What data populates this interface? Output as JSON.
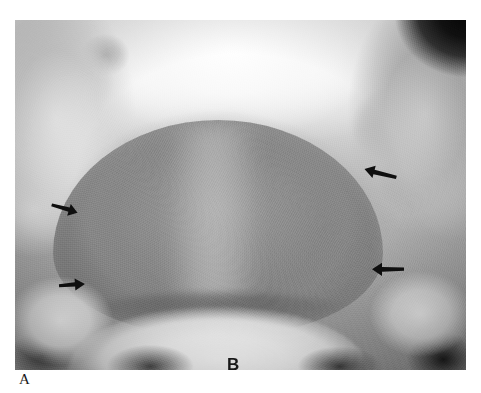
{
  "figure": {
    "panel_label": "A",
    "inner_label": "B",
    "modality": "radiograph",
    "view": "anteroposterior pelvis",
    "background_color": "#ffffff"
  },
  "radiograph": {
    "name": "pelvic-radiograph",
    "left": 15,
    "top": 20,
    "width": 451,
    "height": 350,
    "tone_light": "#f7f7f7",
    "tone_mid": "#a6a6a6",
    "tone_dark": "#1a1a1a"
  },
  "structures": [
    {
      "name": "dome-opacity",
      "description": "large dome-shaped soft-tissue opacity in central pelvis",
      "tone": "#8e8e8e"
    },
    {
      "name": "bright-crescent",
      "description": "bright crescent beneath dome",
      "tone": "#f0f0f0"
    },
    {
      "name": "iliac-bone-left",
      "description": "left iliac bone and acetabulum",
      "tone": "#dcdcdc"
    },
    {
      "name": "iliac-bone-right",
      "description": "right iliac bone and acetabulum",
      "tone": "#c4c4c4"
    },
    {
      "name": "film-corner-dark",
      "description": "dark collimated corner upper right",
      "tone": "#101010"
    }
  ],
  "arrows": [
    {
      "name": "arrow-left-upper",
      "direction": "right-down",
      "rotation": 18,
      "color": "#111111"
    },
    {
      "name": "arrow-left-lower",
      "direction": "right",
      "rotation": -4,
      "color": "#111111"
    },
    {
      "name": "arrow-right-upper",
      "direction": "left-down",
      "rotation": -166,
      "color": "#111111"
    },
    {
      "name": "arrow-right-lower",
      "direction": "left",
      "rotation": 180,
      "color": "#111111"
    }
  ]
}
